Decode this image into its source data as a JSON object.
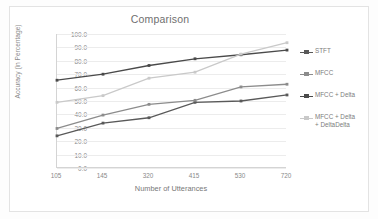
{
  "chart_data": {
    "type": "line",
    "title": "Comparison",
    "xlabel": "Number of Utterances",
    "ylabel": "Accuracy (in Percentage)",
    "categories": [
      "105",
      "145",
      "320",
      "415",
      "530",
      "720"
    ],
    "x_tick_labels": [
      "105",
      "145",
      "320",
      "415",
      "530",
      "720"
    ],
    "y_tick_labels": [
      "0.0",
      "10.0",
      "20.0",
      "30.0",
      "40.0",
      "50.0",
      "60.0",
      "70.0",
      "80.0",
      "90.0",
      "100.0"
    ],
    "y_ticks": [
      0,
      10,
      20,
      30,
      40,
      50,
      60,
      70,
      80,
      90,
      100
    ],
    "ylim": [
      0,
      100
    ],
    "grid": "horizontal",
    "legend_position": "right",
    "series": [
      {
        "name": "STFT",
        "values": [
          24.0,
          33.5,
          37.5,
          49.0,
          50.0,
          54.5
        ],
        "color": "#595959",
        "marker": "square"
      },
      {
        "name": "MFCC",
        "values": [
          29.5,
          39.5,
          47.5,
          50.5,
          60.5,
          62.5
        ],
        "color": "#8c8c8c",
        "marker": "square"
      },
      {
        "name": "MFCC + Delta",
        "values": [
          65.5,
          70.0,
          76.5,
          81.5,
          84.5,
          88.0
        ],
        "color": "#4a4a4a",
        "marker": "square"
      },
      {
        "name": "MFCC + Delta + DeltaDelta",
        "values": [
          49.0,
          54.0,
          67.0,
          71.5,
          85.0,
          93.5
        ],
        "color": "#c9c9c9",
        "marker": "square"
      }
    ]
  },
  "legend": {
    "items": [
      {
        "label": "STFT"
      },
      {
        "label": "MFCC"
      },
      {
        "label": "MFCC + Delta"
      },
      {
        "label": "MFCC + Delta\n+ DeltaDelta"
      }
    ]
  }
}
